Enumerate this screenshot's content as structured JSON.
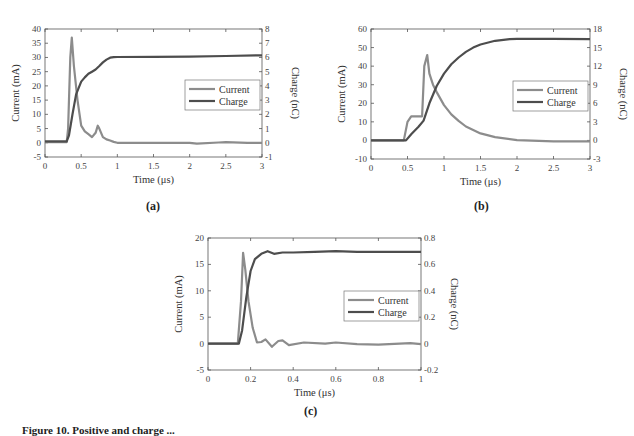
{
  "colors": {
    "current": "#8c8c8c",
    "charge": "#4d4d4d",
    "axis": "#555555",
    "legend_border": "#777777"
  },
  "caption": "Figure 10. Positive and charge ...",
  "chart_data": [
    {
      "id": "a",
      "panel_label": "(a)",
      "type": "line",
      "title": "",
      "xlabel": "Time (μs)",
      "ylabel": "Current (mA)",
      "y2label": "Charge (nC)",
      "xlim": [
        0,
        3
      ],
      "ylim": [
        -5,
        40
      ],
      "y2lim": [
        -1,
        8
      ],
      "xticks": [
        0,
        0.5,
        1,
        1.5,
        2,
        2.5,
        3
      ],
      "yticks": [
        -5,
        0,
        5,
        10,
        15,
        20,
        25,
        30,
        35,
        40
      ],
      "y2ticks": [
        -1,
        0,
        1,
        2,
        3,
        4,
        5,
        6,
        7,
        8
      ],
      "legend": [
        "Current",
        "Charge"
      ],
      "legend_position": "center-right",
      "grid": false,
      "series": [
        {
          "name": "Current",
          "axis": "left",
          "x": [
            0,
            0.3,
            0.32,
            0.35,
            0.37,
            0.4,
            0.45,
            0.5,
            0.55,
            0.6,
            0.65,
            0.7,
            0.73,
            0.75,
            0.8,
            0.85,
            0.9,
            0.95,
            1.0,
            1.2,
            1.5,
            2.0,
            2.1,
            2.4,
            2.5,
            2.8,
            3.0
          ],
          "values": [
            0.2,
            0.2,
            5,
            30,
            37,
            27,
            15,
            6,
            4,
            3,
            2,
            3.5,
            6,
            5,
            2,
            1.2,
            0.8,
            0.3,
            0,
            0,
            0,
            0,
            -0.3,
            0.1,
            0.2,
            0,
            0
          ]
        },
        {
          "name": "Charge",
          "axis": "right",
          "x": [
            0,
            0.3,
            0.33,
            0.38,
            0.43,
            0.5,
            0.55,
            0.6,
            0.65,
            0.7,
            0.75,
            0.8,
            0.85,
            0.9,
            0.95,
            1.0,
            1.5,
            2.0,
            2.5,
            3.0
          ],
          "values": [
            0.1,
            0.1,
            0.5,
            2.0,
            3.4,
            4.3,
            4.6,
            4.85,
            5.0,
            5.15,
            5.4,
            5.65,
            5.85,
            5.98,
            6.02,
            6.03,
            6.04,
            6.05,
            6.1,
            6.15
          ]
        }
      ]
    },
    {
      "id": "b",
      "panel_label": "(b)",
      "type": "line",
      "title": "",
      "xlabel": "Time (μs)",
      "ylabel": "Current (mA)",
      "y2label": "Charge (nC)",
      "xlim": [
        0,
        3
      ],
      "ylim": [
        -10,
        60
      ],
      "y2lim": [
        -3,
        18
      ],
      "xticks": [
        0,
        0.5,
        1,
        1.5,
        2,
        2.5,
        3
      ],
      "yticks": [
        -10,
        0,
        10,
        20,
        30,
        40,
        50,
        60
      ],
      "y2ticks": [
        -3,
        0,
        3,
        6,
        9,
        12,
        15,
        18
      ],
      "legend": [
        "Current",
        "Charge"
      ],
      "legend_position": "center-right",
      "grid": false,
      "series": [
        {
          "name": "Current",
          "axis": "left",
          "x": [
            0,
            0.45,
            0.5,
            0.55,
            0.6,
            0.7,
            0.73,
            0.77,
            0.8,
            0.85,
            0.9,
            1.0,
            1.1,
            1.2,
            1.3,
            1.5,
            1.7,
            2.0,
            2.5,
            3.0
          ],
          "values": [
            0,
            0,
            10,
            13,
            13,
            13,
            40,
            46,
            36,
            30,
            26,
            19,
            14,
            10.5,
            7.5,
            3.8,
            1.8,
            0.2,
            -0.5,
            -0.5
          ]
        },
        {
          "name": "Charge",
          "axis": "right",
          "x": [
            0,
            0.48,
            0.55,
            0.65,
            0.72,
            0.8,
            0.9,
            1.0,
            1.1,
            1.2,
            1.3,
            1.4,
            1.5,
            1.7,
            1.9,
            2.0,
            2.5,
            3.0
          ],
          "values": [
            0,
            0,
            1.0,
            2.2,
            3.2,
            6.0,
            8.8,
            10.8,
            12.3,
            13.4,
            14.3,
            15.0,
            15.5,
            16.1,
            16.35,
            16.4,
            16.4,
            16.35
          ]
        }
      ]
    },
    {
      "id": "c",
      "panel_label": "(c)",
      "type": "line",
      "title": "",
      "xlabel": "Time (μs)",
      "ylabel": "Current (mA)",
      "y2label": "Charge (nC)",
      "xlim": [
        0,
        1
      ],
      "ylim": [
        -5,
        20
      ],
      "y2lim": [
        -0.2,
        0.8
      ],
      "xticks": [
        0,
        0.2,
        0.4,
        0.6,
        0.8,
        1
      ],
      "yticks": [
        -5,
        0,
        5,
        10,
        15,
        20
      ],
      "y2ticks": [
        -0.2,
        0,
        0.2,
        0.4,
        0.6,
        0.8
      ],
      "legend": [
        "Current",
        "Charge"
      ],
      "legend_position": "center-right",
      "grid": false,
      "series": [
        {
          "name": "Current",
          "axis": "left",
          "x": [
            0,
            0.14,
            0.155,
            0.165,
            0.175,
            0.19,
            0.21,
            0.23,
            0.25,
            0.27,
            0.3,
            0.33,
            0.35,
            0.38,
            0.45,
            0.55,
            0.6,
            0.7,
            0.8,
            0.9,
            0.95,
            1.0
          ],
          "values": [
            0,
            0,
            8,
            17.2,
            14,
            8,
            3,
            0.2,
            0.3,
            0.8,
            -0.6,
            0.5,
            0.6,
            -0.3,
            0.2,
            0,
            0.2,
            -0.1,
            -0.2,
            0,
            0.1,
            -0.1
          ]
        },
        {
          "name": "Charge",
          "axis": "right",
          "x": [
            0,
            0.145,
            0.16,
            0.18,
            0.2,
            0.22,
            0.25,
            0.28,
            0.31,
            0.35,
            0.4,
            0.5,
            0.6,
            0.7,
            0.8,
            0.9,
            1.0
          ],
          "values": [
            0,
            0,
            0.1,
            0.35,
            0.55,
            0.64,
            0.68,
            0.7,
            0.68,
            0.69,
            0.69,
            0.695,
            0.7,
            0.695,
            0.695,
            0.695,
            0.695
          ]
        }
      ]
    }
  ]
}
